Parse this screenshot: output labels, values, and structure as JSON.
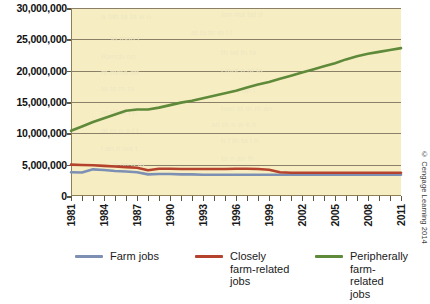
{
  "chart_data": {
    "type": "line",
    "title": "",
    "xlabel": "",
    "ylabel": "",
    "x": [
      1981,
      1982,
      1983,
      1984,
      1985,
      1986,
      1987,
      1988,
      1989,
      1990,
      1991,
      1992,
      1993,
      1994,
      1995,
      1996,
      1997,
      1998,
      1999,
      2000,
      2001,
      2002,
      2003,
      2004,
      2005,
      2006,
      2007,
      2008,
      2009,
      2010,
      2011
    ],
    "xlim": [
      1981,
      2011
    ],
    "ylim": [
      0,
      30000000
    ],
    "yticks": [
      0,
      5000000,
      10000000,
      15000000,
      20000000,
      25000000,
      30000000
    ],
    "ytick_labels": [
      "0",
      "5,000,000",
      "10,000,000",
      "15,000,000",
      "20,000,000",
      "25,000,000",
      "30,000,000"
    ],
    "xtick_labels": [
      "1981",
      "1984",
      "1987",
      "1990",
      "1993",
      "1996",
      "1999",
      "2002",
      "2005",
      "2008",
      "2011"
    ],
    "xtick_step_years": 3,
    "grid": true,
    "legend_position": "bottom",
    "series": [
      {
        "name": "Farm jobs",
        "color": "#7d90b4",
        "values": [
          3800000,
          3750000,
          4250000,
          4150000,
          4000000,
          3900000,
          3800000,
          3450000,
          3500000,
          3500000,
          3450000,
          3450000,
          3400000,
          3400000,
          3400000,
          3400000,
          3400000,
          3400000,
          3400000,
          3400000,
          3400000,
          3400000,
          3400000,
          3400000,
          3400000,
          3400000,
          3400000,
          3400000,
          3400000,
          3400000,
          3400000
        ]
      },
      {
        "name": "Closely\nfarm-related\njobs",
        "color": "#b5422c",
        "values": [
          5000000,
          4950000,
          4900000,
          4800000,
          4700000,
          4600000,
          4500000,
          4100000,
          4350000,
          4350000,
          4300000,
          4300000,
          4300000,
          4300000,
          4300000,
          4350000,
          4350000,
          4300000,
          4200000,
          3800000,
          3700000,
          3700000,
          3700000,
          3700000,
          3700000,
          3700000,
          3700000,
          3700000,
          3700000,
          3700000,
          3700000
        ]
      },
      {
        "name": "Peripherally\nfarm-related\njobs",
        "color": "#5f8a3a",
        "values": [
          10400000,
          11100000,
          11800000,
          12400000,
          13000000,
          13600000,
          13800000,
          13800000,
          14100000,
          14500000,
          14900000,
          15200000,
          15600000,
          16000000,
          16400000,
          16800000,
          17300000,
          17800000,
          18200000,
          18700000,
          19200000,
          19700000,
          20200000,
          20700000,
          21200000,
          21800000,
          22300000,
          22700000,
          23000000,
          23300000,
          23600000
        ]
      }
    ]
  },
  "legend": {
    "items": [
      {
        "label": "Farm jobs",
        "color": "#7d90b4"
      },
      {
        "label": "Closely\nfarm-related\njobs",
        "color": "#b5422c"
      },
      {
        "label": "Peripherally\nfarm-related\njobs",
        "color": "#5f8a3a"
      }
    ]
  },
  "credit": "© Cengage Learning 2014",
  "colors": {
    "plot_background": "#f6eec2",
    "gridline": "#8a8067",
    "axis": "#8c7f55",
    "page_background": "#ffffff"
  }
}
